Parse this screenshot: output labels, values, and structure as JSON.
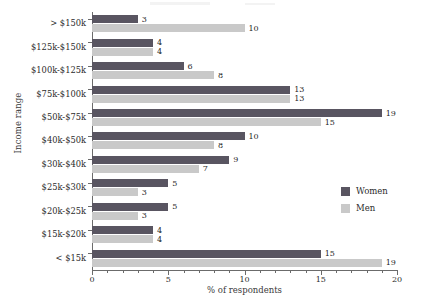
{
  "chart_data": {
    "type": "bar",
    "orientation": "horizontal",
    "title": "",
    "xlabel": "% of respondents",
    "ylabel": "Income range",
    "xlim": [
      0,
      20
    ],
    "xticks": [
      0,
      5,
      10,
      15,
      20
    ],
    "xtick_labels": [
      "0",
      "5",
      "10",
      "15",
      "20"
    ],
    "minor_tick_step": 1,
    "grid": false,
    "legend_position": "middle-right",
    "categories": [
      "> $150k",
      "$125k-$150k",
      "$100k-$125k",
      "$75k-$100k",
      "$50k-$75k",
      "$40k-$50k",
      "$30k-$40k",
      "$25k-$30k",
      "$20k-$25k",
      "$15k-$20k",
      "< $15k"
    ],
    "series": [
      {
        "name": "Women",
        "color": "#595561",
        "values": [
          3,
          4,
          6,
          13,
          19,
          10,
          9,
          5,
          5,
          4,
          15
        ]
      },
      {
        "name": "Men",
        "color": "#c9c9c9",
        "values": [
          10,
          4,
          8,
          13,
          15,
          8,
          7,
          3,
          3,
          4,
          19
        ]
      }
    ]
  },
  "legend": {
    "entries": [
      {
        "label": "Women",
        "color": "#595561"
      },
      {
        "label": "Men",
        "color": "#c9c9c9"
      }
    ]
  }
}
